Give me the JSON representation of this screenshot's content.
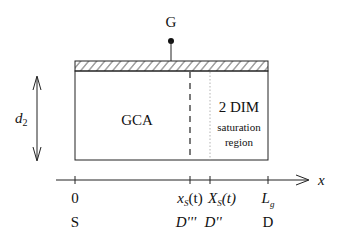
{
  "diagram": {
    "gate_label": "G",
    "thickness_label_main": "d",
    "thickness_label_sub": "2",
    "region_gca_label": "GCA",
    "region_2dim_label": "2 DIM",
    "region_2dim_sub1": "saturation",
    "region_2dim_sub2": "region",
    "axis_label": "x",
    "ticks": [
      {
        "label_main": "0",
        "label_sub": "",
        "label_suffix": "",
        "bottom": "S",
        "x": 75
      },
      {
        "label_main": "x",
        "label_sub": "S",
        "label_suffix": "(t)",
        "bottom": "D'''",
        "x": 190
      },
      {
        "label_main": "X",
        "label_sub": "S",
        "label_suffix": "(t)",
        "bottom": "D''",
        "x": 210
      },
      {
        "label_main": "L",
        "label_sub": "g",
        "label_suffix": "",
        "bottom": "D",
        "x": 268
      }
    ],
    "colors": {
      "stroke": "#222222",
      "dotted": "#aaaaaa",
      "background": "#ffffff"
    }
  }
}
